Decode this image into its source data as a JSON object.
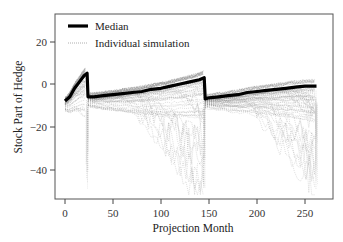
{
  "chart_data": {
    "type": "line",
    "title": "",
    "xlabel": "Projection Month",
    "ylabel": "Stock Part of Hedge",
    "xlim": [
      -5,
      272
    ],
    "ylim": [
      -53,
      33
    ],
    "xticks": [
      0,
      50,
      100,
      150,
      200,
      250
    ],
    "yticks": [
      20,
      0,
      -20,
      -40
    ],
    "grid": false,
    "legend": {
      "position": "upper left",
      "entries": [
        "Median",
        "Individual simulation"
      ]
    },
    "series": [
      {
        "name": "Median",
        "style": "thick solid black",
        "x": [
          0,
          5,
          10,
          15,
          20,
          23,
          24,
          30,
          40,
          50,
          60,
          70,
          80,
          90,
          100,
          110,
          120,
          130,
          140,
          145,
          146,
          150,
          160,
          170,
          180,
          190,
          200,
          210,
          220,
          230,
          240,
          250,
          262
        ],
        "y": [
          -8,
          -6,
          -2,
          1,
          4,
          5,
          -6,
          -6,
          -5.5,
          -5,
          -4.5,
          -4,
          -3.5,
          -2.5,
          -2,
          -1,
          0,
          1,
          2,
          3,
          -7,
          -6.5,
          -6,
          -5.5,
          -5,
          -4,
          -3.5,
          -3,
          -2.5,
          -2,
          -1.5,
          -1,
          -1
        ]
      },
      {
        "name": "Individual simulation",
        "style": "thin dotted gray",
        "description": "Many simulated paths forming a dense band mostly between the median and about -20, with tails reaching down to about -50 near months 20-24, 140-146 and 255-262; upper envelope slightly above median (about +7 near month 23, +4 near 145)",
        "envelope_upper": {
          "x": [
            0,
            23,
            24,
            145,
            146,
            262
          ],
          "y": [
            -2,
            7,
            -4,
            4,
            -5,
            0
          ]
        },
        "envelope_lower": {
          "x": [
            0,
            23,
            24,
            145,
            146,
            262
          ],
          "y": [
            -30,
            -52,
            -15,
            -45,
            -12,
            -50
          ]
        }
      }
    ]
  },
  "legend": {
    "median_label": "Median",
    "individual_label": "Individual simulation"
  },
  "axes": {
    "x_title": "Projection Month",
    "y_title": "Stock Part of Hedge",
    "x_tick_labels": [
      "0",
      "50",
      "100",
      "150",
      "200",
      "250"
    ],
    "y_tick_labels": [
      "20",
      "0",
      "−20",
      "−40"
    ]
  },
  "colors": {
    "median": "#000000",
    "simulation": "#8a8a8a",
    "frame": "#444444"
  }
}
